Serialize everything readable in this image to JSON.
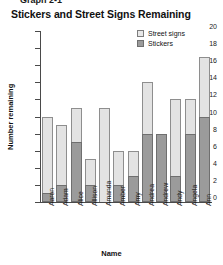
{
  "figure": {
    "graph_number": "Graph 2-1",
    "title": "Stickers and Street Signs Remaining"
  },
  "legend": {
    "position": "top-right",
    "entries": [
      {
        "label": "Street signs",
        "swatch": "light",
        "color": "#e3e3e3"
      },
      {
        "label": "Stickers",
        "swatch": "dark",
        "color": "#9b9b9b"
      }
    ]
  },
  "axes": {
    "ylabel": "Number remaining",
    "xlabel": "Name",
    "yticks": [
      20,
      18,
      16,
      14,
      12,
      10,
      8,
      6,
      4,
      2,
      0
    ],
    "ylim": [
      0,
      20
    ]
  },
  "chart_data": {
    "type": "bar",
    "stacked": true,
    "title": "Stickers and Street Signs Remaining",
    "xlabel": "Name",
    "ylabel": "Number remaining",
    "ylim": [
      0,
      20
    ],
    "ytick_step": 2,
    "grid": false,
    "legend_position": "top-right",
    "categories": [
      "Aaron",
      "Adam",
      "Alice",
      "Allison",
      "Amanda",
      "Amber",
      "Amy",
      "Andrea",
      "Andrew",
      "Andy",
      "Angela",
      "Ann"
    ],
    "series": [
      {
        "name": "Stickers",
        "color": "#9b9b9b",
        "values": [
          1,
          2,
          7,
          2,
          0,
          2,
          3,
          8,
          8,
          3,
          8,
          10
        ]
      },
      {
        "name": "Street signs",
        "color": "#e3e3e3",
        "values": [
          9,
          7,
          4,
          3,
          11,
          4,
          3,
          6,
          0,
          9,
          4,
          7
        ]
      }
    ],
    "totals": [
      10,
      9,
      11,
      5,
      11,
      6,
      6,
      14,
      8,
      12,
      12,
      17
    ]
  }
}
